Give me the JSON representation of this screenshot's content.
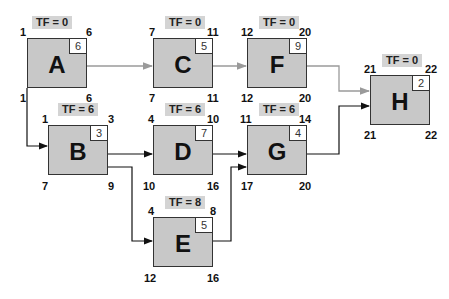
{
  "diagram": {
    "type": "precedence network (activity-on-node) with total float",
    "colors": {
      "node_fill": "#c8c8c8",
      "tf_label_bg": "#d4d4d4",
      "critical_arrow": "#9a9a9a",
      "noncritical_arrow": "#111111"
    },
    "nodes": [
      {
        "id": "A",
        "duration": "6",
        "es": "1",
        "ef": "6",
        "ls": "1",
        "lf": "6",
        "tf": "TF = 0"
      },
      {
        "id": "C",
        "duration": "5",
        "es": "7",
        "ef": "11",
        "ls": "7",
        "lf": "11",
        "tf": "TF = 0"
      },
      {
        "id": "F",
        "duration": "9",
        "es": "12",
        "ef": "20",
        "ls": "12",
        "lf": "20",
        "tf": "TF = 0"
      },
      {
        "id": "H",
        "duration": "2",
        "es": "21",
        "ef": "22",
        "ls": "21",
        "lf": "22",
        "tf": "TF = 0"
      },
      {
        "id": "B",
        "duration": "3",
        "es": "1",
        "ef": "3",
        "ls": "7",
        "lf": "9",
        "tf": "TF = 6"
      },
      {
        "id": "D",
        "duration": "7",
        "es": "4",
        "ef": "10",
        "ls": "10",
        "lf": "16",
        "tf": "TF = 6"
      },
      {
        "id": "G",
        "duration": "4",
        "es": "11",
        "ef": "14",
        "ls": "17",
        "lf": "20",
        "tf": "TF = 6"
      },
      {
        "id": "E",
        "duration": "5",
        "es": "4",
        "ef": "8",
        "ls": "12",
        "lf": "16",
        "tf": "TF = 8"
      }
    ],
    "edges": [
      {
        "from": "A",
        "to": "C",
        "critical": true
      },
      {
        "from": "C",
        "to": "F",
        "critical": true
      },
      {
        "from": "F",
        "to": "H",
        "critical": true
      },
      {
        "from": "A",
        "to": "B",
        "critical": false
      },
      {
        "from": "B",
        "to": "D",
        "critical": false
      },
      {
        "from": "B",
        "to": "E",
        "critical": false
      },
      {
        "from": "D",
        "to": "G",
        "critical": false
      },
      {
        "from": "E",
        "to": "G",
        "critical": false
      },
      {
        "from": "G",
        "to": "H",
        "critical": false
      }
    ]
  }
}
